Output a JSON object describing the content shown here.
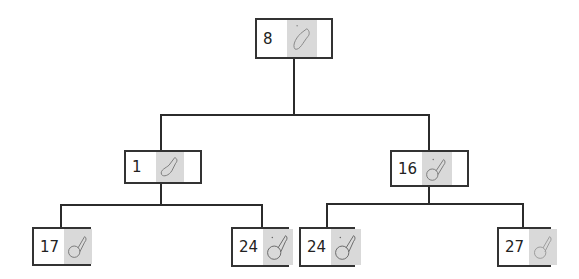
{
  "diagram": {
    "type": "tree",
    "nodes": [
      {
        "id": "root",
        "label": "8",
        "icon": "mouse-icon",
        "level": 0
      },
      {
        "id": "l1-left",
        "label": "1",
        "icon": "mouse-icon",
        "level": 1,
        "parent": "root"
      },
      {
        "id": "l1-right",
        "label": "16",
        "icon": "mouse-icon",
        "level": 1,
        "parent": "root"
      },
      {
        "id": "l2-a",
        "label": "17",
        "icon": "mouse-icon",
        "level": 2,
        "parent": "l1-left"
      },
      {
        "id": "l2-b",
        "label": "24",
        "icon": "mouse-icon",
        "level": 2,
        "parent": "l1-left"
      },
      {
        "id": "l2-c",
        "label": "24",
        "icon": "mouse-icon",
        "level": 2,
        "parent": "l1-right"
      },
      {
        "id": "l2-d",
        "label": "27",
        "icon": "mouse-icon",
        "level": 2,
        "parent": "l1-right"
      }
    ],
    "colors": {
      "line": "#2b2b2b",
      "border": "#333333",
      "thumb": "#d9d9d9"
    }
  }
}
